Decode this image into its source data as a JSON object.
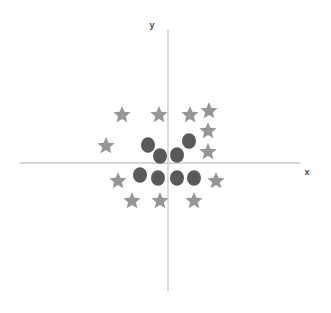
{
  "figure": {
    "background_color": "#ffffff",
    "width": 331,
    "height": 313
  },
  "axes": {
    "x_axis_label": "x",
    "y_axis_label": "y",
    "axis_color": "#c9c9c9",
    "origin": {
      "x": 168,
      "y": 163
    },
    "x_axis_start": {
      "x": 20,
      "y": 163
    },
    "x_axis_end": {
      "x": 300,
      "y": 163
    },
    "y_axis_start": {
      "x": 168,
      "y": 30
    },
    "y_axis_end": {
      "x": 168,
      "y": 291
    },
    "x_label_position": {
      "x": 307,
      "y": 175
    },
    "y_label_position": {
      "x": 152,
      "y": 28
    }
  },
  "chart_data": {
    "type": "scatter",
    "title": "",
    "xlabel": "x",
    "ylabel": "y",
    "grid": false,
    "legend_position": "none",
    "axis_ticks": [],
    "xlim": [
      -148,
      132
    ],
    "ylim": [
      -128,
      133
    ],
    "note": "Pixel coordinates are relative to the image; data coordinates are relative to the origin at pixel (168,163), y up.",
    "series": [
      {
        "name": "circles",
        "marker": "circle",
        "color": "#595959",
        "marker_size": 14,
        "count": 8,
        "points_px": [
          {
            "x": 148,
            "y": 145
          },
          {
            "x": 160,
            "y": 156
          },
          {
            "x": 177,
            "y": 155
          },
          {
            "x": 189,
            "y": 141
          },
          {
            "x": 140,
            "y": 175
          },
          {
            "x": 158,
            "y": 178
          },
          {
            "x": 177,
            "y": 178
          },
          {
            "x": 194,
            "y": 178
          }
        ],
        "points_data": [
          {
            "x": -20,
            "y": 18
          },
          {
            "x": -8,
            "y": 7
          },
          {
            "x": 9,
            "y": 8
          },
          {
            "x": 21,
            "y": 22
          },
          {
            "x": -28,
            "y": -12
          },
          {
            "x": -10,
            "y": -15
          },
          {
            "x": 9,
            "y": -15
          },
          {
            "x": 26,
            "y": -15
          }
        ]
      },
      {
        "name": "stars",
        "marker": "star",
        "color": "#969696",
        "marker_size": 15,
        "count": 12,
        "points_px": [
          {
            "x": 122,
            "y": 115
          },
          {
            "x": 159,
            "y": 115
          },
          {
            "x": 190,
            "y": 115
          },
          {
            "x": 209,
            "y": 111
          },
          {
            "x": 106,
            "y": 146
          },
          {
            "x": 208,
            "y": 131
          },
          {
            "x": 208,
            "y": 152
          },
          {
            "x": 118,
            "y": 181
          },
          {
            "x": 216,
            "y": 181
          },
          {
            "x": 132,
            "y": 201
          },
          {
            "x": 160,
            "y": 201
          },
          {
            "x": 194,
            "y": 201
          }
        ],
        "points_data": [
          {
            "x": -46,
            "y": 48
          },
          {
            "x": -9,
            "y": 48
          },
          {
            "x": 22,
            "y": 48
          },
          {
            "x": 41,
            "y": 52
          },
          {
            "x": -62,
            "y": 17
          },
          {
            "x": 40,
            "y": 32
          },
          {
            "x": 40,
            "y": 11
          },
          {
            "x": -50,
            "y": -18
          },
          {
            "x": 48,
            "y": -18
          },
          {
            "x": -36,
            "y": -38
          },
          {
            "x": -8,
            "y": -38
          },
          {
            "x": 26,
            "y": -38
          }
        ]
      }
    ]
  }
}
